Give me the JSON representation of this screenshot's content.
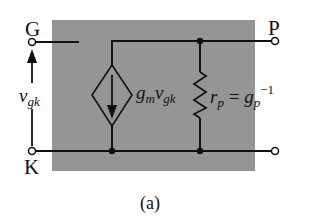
{
  "figure": {
    "caption": "(a)",
    "background_box_color": "#959595",
    "wire_color": "#111111"
  },
  "terminals": {
    "gate": "G",
    "plate": "P",
    "cathode": "K"
  },
  "labels": {
    "input_voltage": {
      "base": "v",
      "sub": "gk"
    },
    "current_source": {
      "g": "g",
      "g_sub": "m",
      "v": "v",
      "v_sub": "gk"
    },
    "resistor": {
      "r": "r",
      "r_sub": "p",
      "eq": " = ",
      "g": "g",
      "g_sub": "p",
      "g_sup": "−1"
    }
  }
}
